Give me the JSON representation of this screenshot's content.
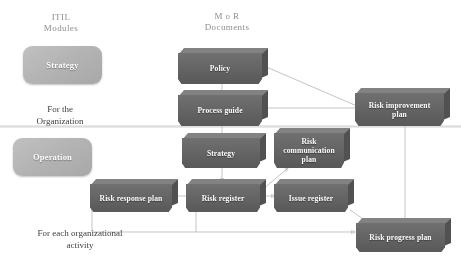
{
  "diagram": {
    "columns": [
      {
        "name": "itil-modules",
        "header": "ITIL\nModules"
      },
      {
        "name": "mor-documents",
        "header": "M o R\nDocuments"
      }
    ],
    "lane_captions": [
      {
        "name": "for-the-organization",
        "text": "For the\nOrganization"
      },
      {
        "name": "for-each-organizational-activity",
        "text": "For  each  organizational\nactivity"
      }
    ],
    "modules": [
      {
        "name": "module-strategy",
        "label": "Strategy"
      },
      {
        "name": "module-operation",
        "label": "Operation"
      }
    ],
    "documents": [
      {
        "name": "doc-policy",
        "label": "Policy"
      },
      {
        "name": "doc-process-guide",
        "label": "Process guide"
      },
      {
        "name": "doc-strategy",
        "label": "Strategy"
      },
      {
        "name": "doc-risk-communication-plan",
        "label": "Risk\ncommunication\nplan"
      },
      {
        "name": "doc-risk-improvement-plan",
        "label": "Risk improvement\nplan"
      },
      {
        "name": "doc-risk-response-plan",
        "label": "Risk response plan"
      },
      {
        "name": "doc-risk-register",
        "label": "Risk register"
      },
      {
        "name": "doc-issue-register",
        "label": "Issue register"
      },
      {
        "name": "doc-risk-progress-plan",
        "label": "Risk progress plan"
      }
    ],
    "colors": {
      "document_fill": "#616161",
      "document_top": "#818181",
      "document_side": "#4e4e4e",
      "module_fill": "#b4b4b4",
      "connector": "#b9b9b9",
      "header_text": "#8d8d8d",
      "caption_text": "#3a3a3a",
      "background": "#ffffff"
    }
  }
}
